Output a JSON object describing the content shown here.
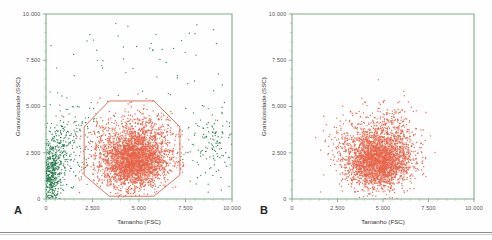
{
  "figure": {
    "caption_letters": [
      "A",
      "B"
    ],
    "bottom_rule": true
  },
  "panels": [
    {
      "letter": "A",
      "xlabel": "Tamanho (FSC)",
      "ylabel": "Granulosidade (SSC)",
      "xticks": [
        "0",
        "2.500",
        "5.000",
        "7.500",
        "10.000"
      ],
      "yticks": [
        "0",
        "2.500",
        "5.000",
        "7.500",
        "10.000"
      ],
      "gate_visible": true,
      "colors": {
        "axis": "#7fae8e",
        "debris": "#237a49",
        "cells": "#e8654a",
        "gate": "#e2684c"
      }
    },
    {
      "letter": "B",
      "xlabel": "Tamanho (FSC)",
      "ylabel": "Granulosidade (SSC)",
      "xticks": [
        "0",
        "2.500",
        "5.000",
        "7.500",
        "10.000"
      ],
      "yticks": [
        "0",
        "2.500",
        "5.000",
        "7.500",
        "10.000"
      ],
      "gate_visible": false,
      "colors": {
        "axis": "#7fae8e",
        "debris": "#237a49",
        "cells": "#e8654a",
        "gate": "#e2684c"
      }
    }
  ],
  "chart_data": {
    "type": "scatter",
    "title": "",
    "subtitle": "",
    "xlabel": "Tamanho (FSC)",
    "ylabel": "Granulosidade (SSC)",
    "xlim": [
      0,
      10000
    ],
    "ylim": [
      0,
      10000
    ],
    "xtick_values": [
      0,
      2500,
      5000,
      7500,
      10000
    ],
    "ytick_values": [
      0,
      2500,
      5000,
      7500,
      10000
    ],
    "xtick_labels": [
      "0",
      "2.500",
      "5.000",
      "7.500",
      "10.000"
    ],
    "ytick_labels": [
      "0",
      "2.500",
      "5.000",
      "7.500",
      "10.000"
    ],
    "grid": false,
    "legend": "none",
    "minor_ticks_per_interval": 5,
    "panels": [
      {
        "id": "A",
        "label": "A",
        "description": "Citometria de fluxo: dispersao frontal (FSC) versus dispersao lateral (SSC) com populacao total, incluindo debris e ruido, e regiao de selecao (gate) octogonal desenhada em laranja.",
        "series": [
          {
            "name": "debris",
            "color": "#237a49",
            "marker": "dot",
            "approx_point_count": 900,
            "clusters": [
              {
                "cx": 250,
                "cy": 1200,
                "sx": 280,
                "sy": 900,
                "n": 420
              },
              {
                "cx": 700,
                "cy": 2200,
                "sx": 500,
                "sy": 1000,
                "n": 200
              },
              {
                "cx": 1600,
                "cy": 3400,
                "sx": 700,
                "sy": 900,
                "n": 120
              },
              {
                "cx": 8800,
                "cy": 3200,
                "sx": 700,
                "sy": 900,
                "n": 120
              },
              {
                "cx": 5000,
                "cy": 7500,
                "sx": 3000,
                "sy": 1500,
                "n": 40
              }
            ]
          },
          {
            "name": "cells",
            "color": "#e8654a",
            "marker": "dot",
            "approx_point_count": 3200,
            "clusters": [
              {
                "cx": 4700,
                "cy": 2000,
                "sx": 900,
                "sy": 700,
                "n": 2400
              },
              {
                "cx": 5200,
                "cy": 3100,
                "sx": 900,
                "sy": 900,
                "n": 700
              },
              {
                "cx": 3200,
                "cy": 3400,
                "sx": 600,
                "sy": 700,
                "n": 100
              }
            ]
          }
        ],
        "gate": {
          "type": "polygon",
          "color": "#e2684c",
          "vertices": [
            [
              3400,
              5300
            ],
            [
              5800,
              5300
            ],
            [
              7200,
              3900
            ],
            [
              7200,
              1300
            ],
            [
              5800,
              150
            ],
            [
              3400,
              150
            ],
            [
              2050,
              1300
            ],
            [
              2050,
              3900
            ]
          ]
        }
      },
      {
        "id": "B",
        "label": "B",
        "description": "Mesma amostra apos selecao do gate: apenas a populacao de interesse (laranja) permanece; debris e ruido foram removidos.",
        "series": [
          {
            "name": "cells",
            "color": "#e8654a",
            "marker": "dot",
            "approx_point_count": 3000,
            "clusters": [
              {
                "cx": 4700,
                "cy": 2000,
                "sx": 900,
                "sy": 700,
                "n": 2200
              },
              {
                "cx": 5200,
                "cy": 3100,
                "sx": 900,
                "sy": 900,
                "n": 650
              },
              {
                "cx": 2900,
                "cy": 3300,
                "sx": 600,
                "sy": 700,
                "n": 90
              }
            ]
          }
        ],
        "gate": null
      }
    ]
  }
}
